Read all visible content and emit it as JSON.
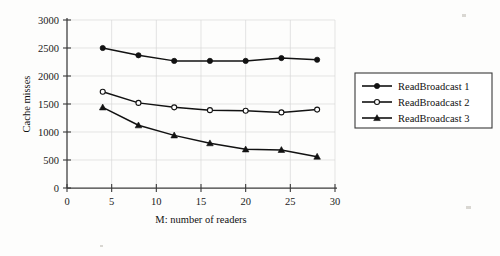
{
  "chart_data": {
    "type": "line",
    "title": "",
    "xlabel": "M: number of readers",
    "ylabel": "Cache misses",
    "xlim": [
      0,
      30
    ],
    "ylim": [
      0,
      3000
    ],
    "xticks": [
      0,
      5,
      10,
      15,
      20,
      25,
      30
    ],
    "yticks": [
      0,
      500,
      1000,
      1500,
      2000,
      2500,
      3000
    ],
    "xtick_labels": [
      "0",
      "5",
      "10",
      "15",
      "20",
      "25",
      "30"
    ],
    "ytick_labels": [
      "0",
      "500",
      "1000",
      "1500",
      "2000",
      "2500",
      "3000"
    ],
    "grid": true,
    "legend_position": "right-outside",
    "x": [
      4,
      8,
      12,
      16,
      20,
      24,
      28
    ],
    "series": [
      {
        "name": "ReadBroadcast 1",
        "marker": "filled-circle",
        "values": [
          2500,
          2370,
          2270,
          2270,
          2270,
          2320,
          2290
        ]
      },
      {
        "name": "ReadBroadcast 2",
        "marker": "open-circle",
        "values": [
          1720,
          1520,
          1440,
          1390,
          1380,
          1350,
          1400
        ]
      },
      {
        "name": "ReadBroadcast 3",
        "marker": "filled-triangle",
        "values": [
          1440,
          1120,
          940,
          800,
          690,
          680,
          560
        ]
      }
    ]
  },
  "legend": {
    "entries": [
      {
        "label": "ReadBroadcast 1"
      },
      {
        "label": "ReadBroadcast 2"
      },
      {
        "label": "ReadBroadcast 3"
      }
    ]
  },
  "colors": {
    "line": "#121212",
    "grid": "#d8d8d8",
    "axis": "#3a3a3a",
    "background": "#fdfdfc"
  }
}
